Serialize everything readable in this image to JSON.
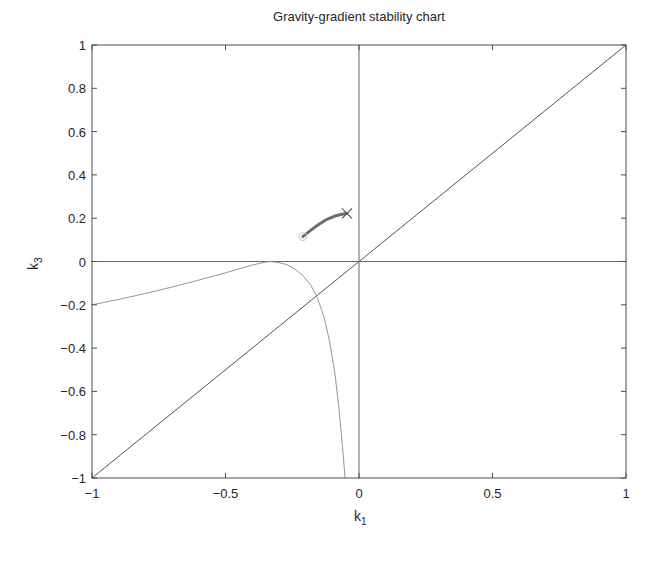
{
  "chart_data": {
    "type": "line",
    "title": "Gravity-gradient stability chart",
    "xlabel": "k_1",
    "ylabel": "k_3",
    "xlim": [
      -1,
      1
    ],
    "ylim": [
      -1,
      1
    ],
    "grid": false,
    "legend": null,
    "xticks": [
      -1,
      -0.5,
      0,
      0.5,
      1
    ],
    "xtick_labels": [
      "−1",
      "−0.5",
      "0",
      "0.5",
      "1"
    ],
    "yticks": [
      -1,
      -0.8,
      -0.6,
      -0.4,
      -0.2,
      0,
      0.2,
      0.4,
      0.6,
      0.8,
      1
    ],
    "ytick_labels": [
      "−1",
      "−0.8",
      "−0.6",
      "−0.4",
      "−0.2",
      "0",
      "0.2",
      "0.4",
      "0.6",
      "0.8",
      "1"
    ],
    "series": [
      {
        "name": "k1 = k3 diagonal",
        "style": "solid",
        "color": "#555555",
        "x": [
          -1,
          1
        ],
        "y": [
          -1,
          1
        ]
      },
      {
        "name": "k1 = 0 axis",
        "style": "solid",
        "color": "#666666",
        "x": [
          0,
          0
        ],
        "y": [
          -1,
          1
        ]
      },
      {
        "name": "k3 = 0 axis",
        "style": "solid",
        "color": "#666666",
        "x": [
          -1,
          1
        ],
        "y": [
          0,
          0
        ]
      },
      {
        "name": "stability boundary (left branch)",
        "style": "thin",
        "color": "#8a8a8a",
        "x": [
          -1,
          -0.9,
          -0.8,
          -0.7,
          -0.6,
          -0.5,
          -0.45,
          -0.4,
          -0.35,
          -0.333
        ],
        "y": [
          -0.2,
          -0.175,
          -0.148,
          -0.118,
          -0.086,
          -0.052,
          -0.034,
          -0.016,
          -0.003,
          0
        ]
      },
      {
        "name": "stability boundary (right branch)",
        "style": "thin",
        "color": "#8a8a8a",
        "x": [
          -0.333,
          -0.3,
          -0.27,
          -0.24,
          -0.21,
          -0.18,
          -0.155,
          -0.13,
          -0.11,
          -0.09,
          -0.075,
          -0.062,
          -0.052
        ],
        "y": [
          0,
          -0.005,
          -0.015,
          -0.035,
          -0.065,
          -0.11,
          -0.17,
          -0.26,
          -0.37,
          -0.52,
          -0.68,
          -0.85,
          -1.0
        ]
      },
      {
        "name": "trajectory",
        "style": "thick",
        "color": "#6e6e6e",
        "x": [
          -0.21,
          -0.18,
          -0.15,
          -0.12,
          -0.09,
          -0.065,
          -0.045
        ],
        "y": [
          0.115,
          0.145,
          0.172,
          0.195,
          0.21,
          0.218,
          0.222
        ]
      }
    ],
    "markers": [
      {
        "name": "start",
        "shape": "circle",
        "x": -0.21,
        "y": 0.115
      },
      {
        "name": "end",
        "shape": "x",
        "x": -0.045,
        "y": 0.222
      }
    ]
  }
}
